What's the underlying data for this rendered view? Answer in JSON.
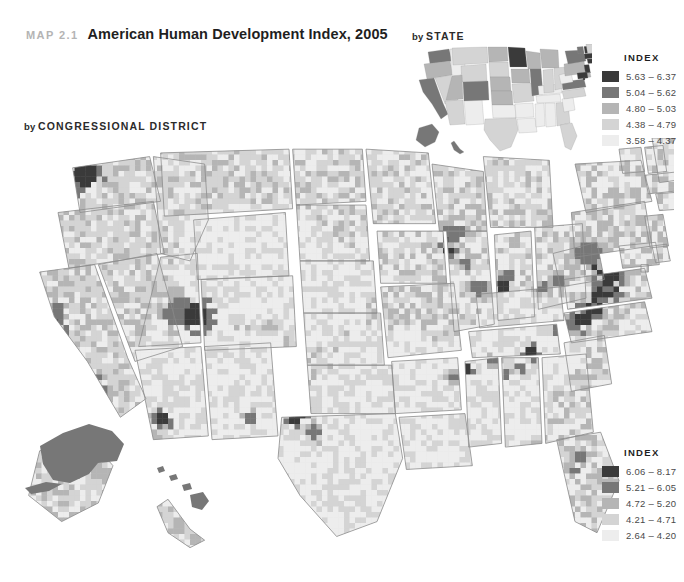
{
  "header": {
    "map_number": "MAP 2.1",
    "title": "American Human Development Index, 2005"
  },
  "panels": {
    "state": {
      "by": "by ",
      "scope": "STATE"
    },
    "district": {
      "by": "by ",
      "scope": "CONGRESSIONAL DISTRICT"
    }
  },
  "palette": {
    "c5": "#3a3a3a",
    "c4": "#777777",
    "c3": "#b5b5b5",
    "c2": "#d4d4d4",
    "c1": "#ededed",
    "border": "#8a8a8a",
    "background": "#ffffff",
    "title_color": "#1f1f1f",
    "map_number_color": "#b4b4b4"
  },
  "legend_state": {
    "title": "INDEX",
    "rows": [
      {
        "color": "#3a3a3a",
        "label": "5.63 – 6.37"
      },
      {
        "color": "#777777",
        "label": "5.04 – 5.62"
      },
      {
        "color": "#b5b5b5",
        "label": "4.80 – 5.03"
      },
      {
        "color": "#d4d4d4",
        "label": "4.38 – 4.79"
      },
      {
        "color": "#ededed",
        "label": "3.58 – 4.37"
      }
    ]
  },
  "legend_district": {
    "title": "INDEX",
    "rows": [
      {
        "color": "#3a3a3a",
        "label": "6.06 – 8.17"
      },
      {
        "color": "#777777",
        "label": "5.21 – 6.05"
      },
      {
        "color": "#b5b5b5",
        "label": "4.72 – 5.20"
      },
      {
        "color": "#d4d4d4",
        "label": "4.21 – 4.71"
      },
      {
        "color": "#ededed",
        "label": "2.64 – 4.20"
      }
    ]
  },
  "chart_data": {
    "type": "map",
    "title": "American Human Development Index, 2005",
    "subtitle": "MAP 2.1",
    "maps": [
      {
        "name": "by STATE",
        "unit": "state",
        "legend_title": "INDEX",
        "bins": [
          {
            "rank": 5,
            "range": "5.63 – 6.37",
            "min": 5.63,
            "max": 6.37,
            "color": "#3a3a3a"
          },
          {
            "rank": 4,
            "range": "5.04 – 5.62",
            "min": 5.04,
            "max": 5.62,
            "color": "#777777"
          },
          {
            "rank": 3,
            "range": "4.80 – 5.03",
            "min": 4.8,
            "max": 5.03,
            "color": "#b5b5b5"
          },
          {
            "rank": 2,
            "range": "4.38 – 4.79",
            "min": 4.38,
            "max": 4.79,
            "color": "#d4d4d4"
          },
          {
            "rank": 1,
            "range": "3.58 – 4.37",
            "min": 3.58,
            "max": 4.37,
            "color": "#ededed"
          }
        ],
        "values": {
          "WA": 4,
          "OR": 3,
          "CA": 4,
          "NV": 2,
          "ID": 1,
          "MT": 2,
          "WY": 2,
          "UT": 3,
          "AZ": 2,
          "NM": 1,
          "CO": 4,
          "ND": 3,
          "SD": 2,
          "NE": 3,
          "KS": 3,
          "OK": 1,
          "TX": 2,
          "MN": 5,
          "IA": 3,
          "MO": 2,
          "AR": 1,
          "LA": 1,
          "WI": 3,
          "IL": 4,
          "MS": 1,
          "AL": 1,
          "TN": 1,
          "KY": 1,
          "IN": 2,
          "MI": 3,
          "OH": 2,
          "GA": 2,
          "FL": 2,
          "SC": 1,
          "NC": 2,
          "VA": 4,
          "WV": 1,
          "PA": 3,
          "NY": 4,
          "VT": 4,
          "NH": 5,
          "ME": 2,
          "MA": 5,
          "RI": 3,
          "CT": 5,
          "NJ": 5,
          "DE": 3,
          "MD": 5,
          "DC": 5,
          "AK": 4,
          "HI": 4
        }
      },
      {
        "name": "by CONGRESSIONAL DISTRICT",
        "unit": "congressional district",
        "legend_title": "INDEX",
        "bins": [
          {
            "rank": 5,
            "range": "6.06 – 8.17",
            "min": 6.06,
            "max": 8.17,
            "color": "#3a3a3a"
          },
          {
            "rank": 4,
            "range": "5.21 – 6.05",
            "min": 5.21,
            "max": 6.05,
            "color": "#777777"
          },
          {
            "rank": 3,
            "range": "4.72 – 5.20",
            "min": 4.72,
            "max": 5.2,
            "color": "#b5b5b5"
          },
          {
            "rank": 2,
            "range": "4.21 – 4.71",
            "min": 4.21,
            "max": 4.71,
            "color": "#d4d4d4"
          },
          {
            "rank": 1,
            "range": "2.64 – 4.20",
            "min": 2.64,
            "max": 4.2,
            "color": "#ededed"
          }
        ],
        "notes": "Highest-index districts cluster in the Northeast corridor (Connecticut, New Jersey, New York, Massachusetts, Maryland, Virginia), Seattle, the San Francisco Bay Area, Los Angeles and Denver. Lowest-index districts concentrate in the rural South, Appalachia, the Rio Grande Valley and the Central Valley of California. Alaska and Hawaii each fall in the 5.21 – 6.05 band."
      }
    ]
  }
}
